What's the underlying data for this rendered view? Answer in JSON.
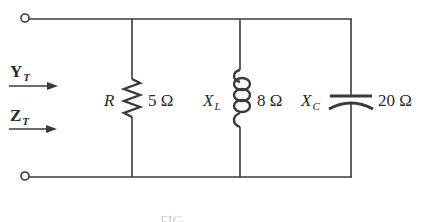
{
  "diagram": {
    "type": "parallel RLC circuit",
    "colors": {
      "line": "#3a3a3a",
      "text": "#2a2a2a",
      "background": "#ffffff"
    },
    "inputs": {
      "admittance": {
        "symbol": "Y",
        "subscript": "T"
      },
      "impedance": {
        "symbol": "Z",
        "subscript": "T"
      }
    },
    "components": [
      {
        "id": "R",
        "kind": "resistor",
        "symbol": "R",
        "subscript": "",
        "value": "5 Ω"
      },
      {
        "id": "XL",
        "kind": "inductor",
        "symbol": "X",
        "subscript": "L",
        "value": "8 Ω"
      },
      {
        "id": "XC",
        "kind": "capacitor",
        "symbol": "X",
        "subscript": "C",
        "value": "20 Ω"
      }
    ],
    "caption": "FIG."
  }
}
